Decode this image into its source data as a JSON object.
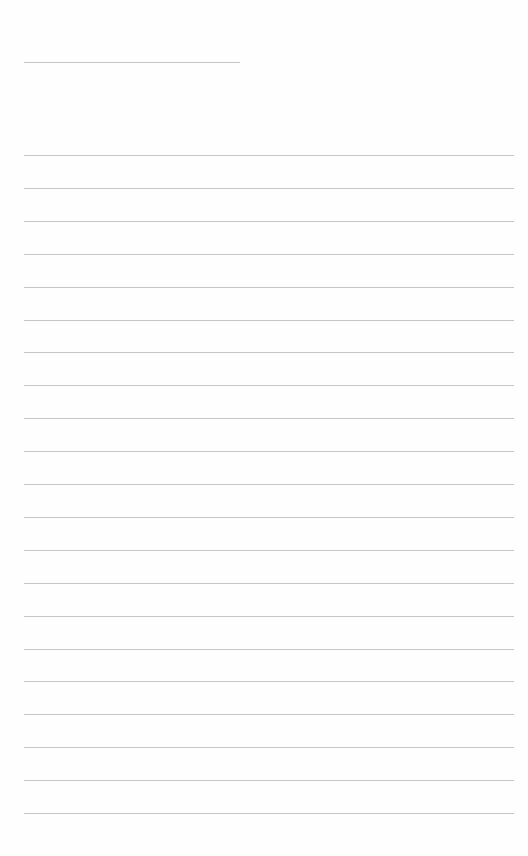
{
  "document": {
    "type": "lined-paper",
    "header_line": {
      "x": 24,
      "y": 62,
      "width": 216
    },
    "ruled_lines": {
      "count": 21,
      "first_y": 155,
      "spacing": 32.9,
      "x": 24,
      "width": 490
    },
    "colors": {
      "paper": "#fefefe",
      "line": "#c6c6c6"
    }
  }
}
